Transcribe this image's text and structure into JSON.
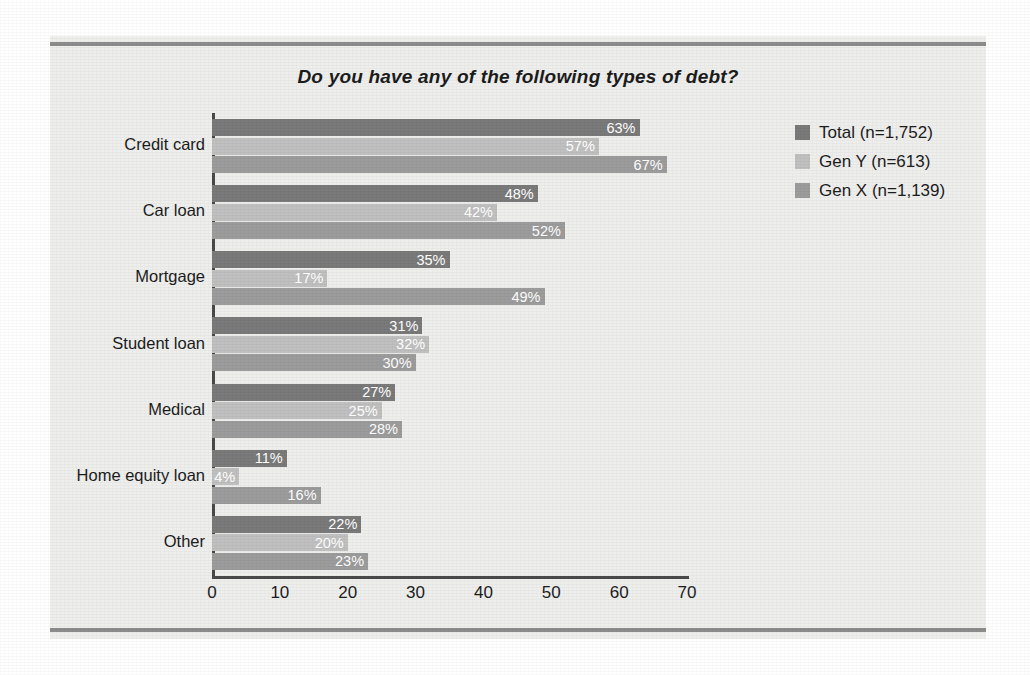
{
  "chart_data": {
    "type": "bar",
    "orientation": "horizontal",
    "title": "Do you have any of the following types of debt?",
    "xlabel": "",
    "ylabel": "",
    "xlim": [
      0,
      70
    ],
    "xticks": [
      0,
      10,
      20,
      30,
      40,
      50,
      60,
      70
    ],
    "grid": false,
    "legend_position": "right",
    "value_suffix": "%",
    "categories": [
      "Credit card",
      "Car loan",
      "Mortgage",
      "Student loan",
      "Medical",
      "Home equity loan",
      "Other"
    ],
    "series": [
      {
        "name": "Total (n=1,752)",
        "color": "#7a7a7a",
        "values": [
          63,
          48,
          35,
          31,
          27,
          11,
          22
        ],
        "labels": [
          "63%",
          "48%",
          "35%",
          "31%",
          "27%",
          "11%",
          "22%"
        ]
      },
      {
        "name": "Gen Y (n=613)",
        "color": "#c0c0c0",
        "values": [
          57,
          42,
          17,
          32,
          25,
          4,
          20
        ],
        "labels": [
          "57%",
          "42%",
          "17%",
          "32%",
          "25%",
          "4%",
          "20%"
        ]
      },
      {
        "name": "Gen X (n=1,139)",
        "color": "#9c9c9c",
        "values": [
          67,
          52,
          49,
          30,
          28,
          16,
          23
        ],
        "labels": [
          "67%",
          "52%",
          "49%",
          "30%",
          "28%",
          "16%",
          "23%"
        ]
      }
    ]
  },
  "legend": {
    "items": [
      {
        "label": "Total (n=1,752)",
        "color": "#7a7a7a"
      },
      {
        "label": "Gen Y (n=613)",
        "color": "#c0c0c0"
      },
      {
        "label": "Gen X (n=1,139)",
        "color": "#9c9c9c"
      }
    ]
  },
  "colors": {
    "panel_background": "#eeeeec",
    "page_background": "#ffffff",
    "rule": "#8c8c8c",
    "axis": "#4a4a4a",
    "text": "#1c1c1c",
    "value_label_text": "#ffffff"
  }
}
